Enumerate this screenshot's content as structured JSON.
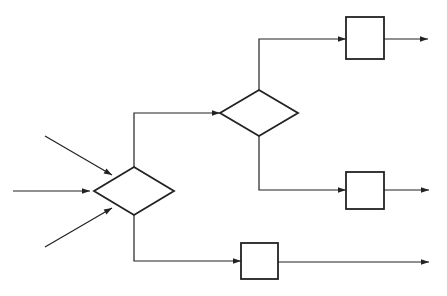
{
  "diagram": {
    "type": "flowchart",
    "stroke_color": "#222222",
    "background": "#ffffff",
    "decisions": [
      {
        "id": "decision-1",
        "cx": 134,
        "cy": 191,
        "hw": 40,
        "hh": 24
      },
      {
        "id": "decision-2",
        "cx": 259,
        "cy": 113,
        "hw": 39,
        "hh": 23
      }
    ],
    "processes": [
      {
        "id": "process-1",
        "x": 346,
        "y": 17,
        "w": 38,
        "h": 42
      },
      {
        "id": "process-2",
        "x": 346,
        "y": 172,
        "w": 38,
        "h": 37
      },
      {
        "id": "process-3",
        "x": 241,
        "y": 243,
        "w": 37,
        "h": 36
      }
    ],
    "inputs": [
      {
        "id": "input-top",
        "from": [
          45,
          136
        ],
        "to": [
          112,
          175
        ]
      },
      {
        "id": "input-middle",
        "from": [
          13,
          191
        ],
        "to": [
          90,
          191
        ]
      },
      {
        "id": "input-bottom",
        "from": [
          45,
          247
        ],
        "to": [
          112,
          208
        ]
      }
    ],
    "outputs": [
      {
        "id": "output-1",
        "from": [
          384,
          39
        ],
        "to": [
          428,
          39
        ]
      },
      {
        "id": "output-2",
        "from": [
          384,
          190
        ],
        "to": [
          429,
          190
        ]
      },
      {
        "id": "output-3",
        "from": [
          278,
          262
        ],
        "to": [
          429,
          262
        ]
      }
    ]
  }
}
